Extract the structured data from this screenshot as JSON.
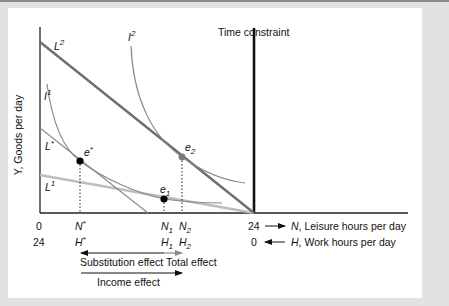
{
  "figure": {
    "y_axis_label": "Y, Goods per day",
    "time_constraint_label": "Time constraint",
    "x_axis": {
      "top_row": {
        "origin": "0",
        "end": "24",
        "arrow_label": "N, Leisure hours per day",
        "ticks": [
          "N*",
          "N1",
          "N2"
        ]
      },
      "bottom_row": {
        "origin": "24",
        "end": "0",
        "arrow_label": "H, Work hours per day",
        "ticks": [
          "H*",
          "H1",
          "H2"
        ]
      }
    },
    "budget_lines": [
      {
        "name": "L2",
        "color": "#6e6e6e"
      },
      {
        "name": "L*",
        "color": "#8c8c8c"
      },
      {
        "name": "L1",
        "color": "#bdbdbd"
      }
    ],
    "indifference_curves": [
      {
        "name": "I1",
        "color": "#8a8a8a"
      },
      {
        "name": "I2",
        "color": "#8a8a8a"
      }
    ],
    "equilibria": [
      {
        "name": "e*",
        "color": "#000000"
      },
      {
        "name": "e1",
        "color": "#000000"
      },
      {
        "name": "e2",
        "color": "#7a7a7a"
      }
    ],
    "effects": {
      "substitution": "Substitution effect",
      "total": "Total effect",
      "income": "Income effect"
    }
  },
  "labels": {
    "L2_base": "L",
    "L2_sup": "2",
    "Lstar_base": "L",
    "Lstar_sup": "*",
    "L1_base": "L",
    "L1_sup": "1",
    "I1_base": "I",
    "I1_sup": "1",
    "I2_base": "I",
    "I2_sup": "2",
    "estar_base": "e",
    "estar_sup": "*",
    "e1_base": "e",
    "e1_sub": "1",
    "e2_base": "e",
    "e2_sub": "2",
    "Nstar_base": "N",
    "Nstar_sup": "*",
    "N1_base": "N",
    "N1_sub": "1",
    "N2_base": "N",
    "N2_sub": "2",
    "Hstar_base": "H",
    "Hstar_sup": "*",
    "H1_base": "H",
    "H1_sub": "1",
    "H2_base": "H",
    "H2_sub": "2",
    "N_axis_var": "N",
    "N_axis_rest": ", Leisure hours per day",
    "H_axis_var": "H",
    "H_axis_rest": ", Work hours per day"
  }
}
